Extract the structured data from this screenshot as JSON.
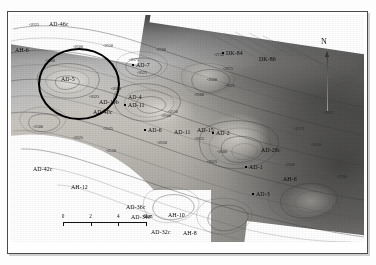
{
  "figure": {
    "type": "structural-contour-map"
  },
  "map": {
    "north_arrow": {
      "label": "N"
    },
    "scale_bar": {
      "ticks": [
        "0",
        "2",
        "4"
      ],
      "unit_label": "6km",
      "values": [
        0,
        2,
        4,
        6
      ],
      "units": "km"
    },
    "highlight": {
      "shape": "ellipse",
      "encircles": "AD-5"
    },
    "wells": [
      {
        "label": "AD-46c",
        "x": 38,
        "y": 7,
        "marker": false
      },
      {
        "label": "AH-6",
        "x": 4,
        "y": 33,
        "marker": false
      },
      {
        "label": "AD-5",
        "x": 50,
        "y": 62,
        "marker": false
      },
      {
        "label": "AD-7",
        "x": 125,
        "y": 48,
        "marker": true
      },
      {
        "label": "DK-84",
        "x": 215,
        "y": 36,
        "marker": true
      },
      {
        "label": "DK-86",
        "x": 248,
        "y": 42,
        "marker": false
      },
      {
        "label": "AD-19b",
        "x": 88,
        "y": 85,
        "marker": false
      },
      {
        "label": "AD-4",
        "x": 117,
        "y": 80,
        "marker": false
      },
      {
        "label": "AD-11",
        "x": 117,
        "y": 88,
        "marker": true
      },
      {
        "label": "AD-40c",
        "x": 82,
        "y": 95,
        "marker": false
      },
      {
        "label": "AD-6",
        "x": 137,
        "y": 113,
        "marker": true
      },
      {
        "label": "AD-11",
        "x": 163,
        "y": 115,
        "marker": false
      },
      {
        "label": "AD-15",
        "x": 186,
        "y": 113,
        "marker": false
      },
      {
        "label": "AD-2",
        "x": 205,
        "y": 116,
        "marker": true
      },
      {
        "label": "AD-28c",
        "x": 250,
        "y": 133,
        "marker": false
      },
      {
        "label": "AD-1",
        "x": 238,
        "y": 150,
        "marker": true
      },
      {
        "label": "AH-6",
        "x": 272,
        "y": 162,
        "marker": false
      },
      {
        "label": "AD-3",
        "x": 245,
        "y": 177,
        "marker": true
      },
      {
        "label": "AD-42c",
        "x": 22,
        "y": 152,
        "marker": false
      },
      {
        "label": "AH-12",
        "x": 60,
        "y": 170,
        "marker": false
      },
      {
        "label": "AD-36c",
        "x": 115,
        "y": 190,
        "marker": false
      },
      {
        "label": "AD-34c",
        "x": 120,
        "y": 200,
        "marker": false
      },
      {
        "label": "AH-10",
        "x": 157,
        "y": 198,
        "marker": false
      },
      {
        "label": "AD-32c",
        "x": 140,
        "y": 215,
        "marker": false
      },
      {
        "label": "AH-8",
        "x": 172,
        "y": 216,
        "marker": false
      },
      {
        "label": "AD-30c",
        "x": 178,
        "y": 230,
        "marker": false
      }
    ],
    "contour_labels": [
      {
        "value": "-2625",
        "x": 18,
        "y": 8
      },
      {
        "value": "-2600",
        "x": 62,
        "y": 30
      },
      {
        "value": "-2650",
        "x": 92,
        "y": 29
      },
      {
        "value": "-2600",
        "x": 34,
        "y": 44
      },
      {
        "value": "-2700",
        "x": 145,
        "y": 33
      },
      {
        "value": "-2675",
        "x": 118,
        "y": 43
      },
      {
        "value": "-2625",
        "x": 126,
        "y": 56
      },
      {
        "value": "-2750",
        "x": 203,
        "y": 38
      },
      {
        "value": "-2675",
        "x": 212,
        "y": 52
      },
      {
        "value": "-2600",
        "x": 100,
        "y": 72
      },
      {
        "value": "-2625",
        "x": 78,
        "y": 80
      },
      {
        "value": "-2600",
        "x": 196,
        "y": 63
      },
      {
        "value": "-2625",
        "x": 214,
        "y": 69
      },
      {
        "value": "-2600",
        "x": 183,
        "y": 78
      },
      {
        "value": "-2550",
        "x": 157,
        "y": 95
      },
      {
        "value": "-2600",
        "x": 150,
        "y": 99
      },
      {
        "value": "-2525",
        "x": 92,
        "y": 112
      },
      {
        "value": "-2650",
        "x": 146,
        "y": 126
      },
      {
        "value": "-2500",
        "x": 22,
        "y": 110
      },
      {
        "value": "-2625",
        "x": 62,
        "y": 121
      },
      {
        "value": "-2625",
        "x": 183,
        "y": 122
      },
      {
        "value": "-2600",
        "x": 206,
        "y": 135
      },
      {
        "value": "-2625",
        "x": 196,
        "y": 145
      },
      {
        "value": "-2550",
        "x": 95,
        "y": 134
      },
      {
        "value": "-2600",
        "x": 274,
        "y": 148
      },
      {
        "value": "-2575",
        "x": 283,
        "y": 112
      },
      {
        "value": "-2650",
        "x": 300,
        "y": 128
      },
      {
        "value": "-2625",
        "x": 312,
        "y": 96
      },
      {
        "value": "-2700",
        "x": 326,
        "y": 160
      }
    ]
  }
}
